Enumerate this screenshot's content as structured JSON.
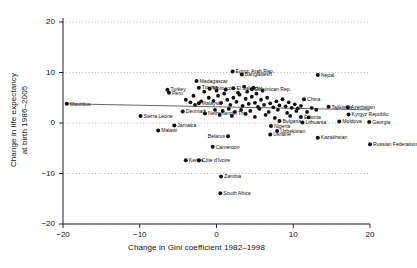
{
  "chart_data": {
    "type": "scatter",
    "title": "",
    "xlabel": "Change in Gini coefficient 1982–1998",
    "ylabel": "Change in life expectancy\nat birth 1986–2005",
    "ylabel_line1": "Change in life expectancy",
    "ylabel_line2": "at birth 1986–2005",
    "xlim": [
      -20,
      20
    ],
    "ylim": [
      -20,
      20
    ],
    "xticks": [
      -20,
      -10,
      0,
      10,
      20
    ],
    "xtick_labels": [
      "−20",
      "−10",
      "0",
      "10",
      "20"
    ],
    "yticks": [
      -20,
      -10,
      0,
      10,
      20
    ],
    "ytick_labels": [
      "−20",
      "−10",
      "0",
      "10",
      "20"
    ],
    "grid": "horizontal-dotted",
    "legend": "none",
    "marker": "filled-circle",
    "marker_color": "#111111",
    "fit_line": {
      "label": "linear fit",
      "x0": -19.5,
      "y0": 3.8,
      "x1": 20.0,
      "y1": 2.6,
      "color": "#555555"
    },
    "points": [
      {
        "label": "Mauritius",
        "x": -19.5,
        "y": 3.8,
        "side": "right"
      },
      {
        "label": "Sierra Leone",
        "x": -9.9,
        "y": 1.4,
        "side": "right"
      },
      {
        "label": "Malawi",
        "x": -7.6,
        "y": -1.5,
        "side": "right"
      },
      {
        "label": "Jamaica",
        "x": -5.5,
        "y": -0.5,
        "side": "right"
      },
      {
        "label": "Turkey",
        "x": -6.4,
        "y": 6.6,
        "side": "right"
      },
      {
        "label": "Peru",
        "x": -6.2,
        "y": 6.0,
        "side": "right"
      },
      {
        "label": "Madagascar",
        "x": -2.6,
        "y": 8.3,
        "side": "right"
      },
      {
        "label": "Tunisia",
        "x": -2.3,
        "y": 7.0,
        "side": "right"
      },
      {
        "label": "Morocco",
        "x": -0.9,
        "y": 6.8,
        "side": "right"
      },
      {
        "label": "El Salvador",
        "x": 2.2,
        "y": 6.9,
        "side": "right"
      },
      {
        "label": "Dominican Rep.",
        "x": 4.6,
        "y": 6.7,
        "side": "right"
      },
      {
        "label": "Egypt, Arab Rep.",
        "x": 2.1,
        "y": 10.2,
        "side": "right"
      },
      {
        "label": "Bangladesh",
        "x": 3.3,
        "y": 9.6,
        "side": "right"
      },
      {
        "label": "Nepal",
        "x": 13.2,
        "y": 9.5,
        "side": "right"
      },
      {
        "label": "Malaysia",
        "x": -2.3,
        "y": 3.9,
        "side": "right"
      },
      {
        "label": "Denmark",
        "x": -4.4,
        "y": 2.3,
        "side": "right"
      },
      {
        "label": "Netherlands, The",
        "x": -1.5,
        "y": 1.9,
        "side": "right"
      },
      {
        "label": "China",
        "x": 11.4,
        "y": 4.7,
        "side": "right"
      },
      {
        "label": "Tajikistan",
        "x": 14.6,
        "y": 3.2,
        "side": "right"
      },
      {
        "label": "Azerbaijan",
        "x": 17.1,
        "y": 3.1,
        "side": "right"
      },
      {
        "label": "Kyrgyz Republic",
        "x": 17.2,
        "y": 1.7,
        "side": "right"
      },
      {
        "label": "Estonia",
        "x": 11.0,
        "y": 1.2,
        "side": "right"
      },
      {
        "label": "Lithuania",
        "x": 11.2,
        "y": 0.1,
        "side": "right"
      },
      {
        "label": "Bulgaria",
        "x": 8.2,
        "y": 0.4,
        "side": "right"
      },
      {
        "label": "Moldova",
        "x": 16.0,
        "y": 0.3,
        "side": "right"
      },
      {
        "label": "Georgia",
        "x": 19.9,
        "y": 0.2,
        "side": "right"
      },
      {
        "label": "Nigeria",
        "x": 7.1,
        "y": -0.6,
        "side": "right"
      },
      {
        "label": "Uzbekistan",
        "x": 7.9,
        "y": -1.6,
        "side": "right"
      },
      {
        "label": "Ukraine",
        "x": 7.0,
        "y": -2.3,
        "side": "right"
      },
      {
        "label": "Belarus",
        "x": 1.5,
        "y": -2.6,
        "side": "left"
      },
      {
        "label": "Kazakhstan",
        "x": 13.2,
        "y": -2.9,
        "side": "right"
      },
      {
        "label": "Russian Federation",
        "x": 20.0,
        "y": -4.2,
        "side": "right"
      },
      {
        "label": "Cameroon",
        "x": -0.5,
        "y": -4.7,
        "side": "right"
      },
      {
        "label": "Kenya",
        "x": -4.0,
        "y": -7.4,
        "side": "right"
      },
      {
        "label": "Côte d'Ivoire",
        "x": -2.3,
        "y": -7.4,
        "side": "right"
      },
      {
        "label": "Zambia",
        "x": 0.6,
        "y": -10.6,
        "side": "right"
      },
      {
        "label": "South Africa",
        "x": 0.5,
        "y": -13.9,
        "side": "right"
      }
    ],
    "unlabeled_points": [
      [
        -1.0,
        5.0
      ],
      [
        -0.4,
        4.4
      ],
      [
        0.2,
        5.4
      ],
      [
        0.6,
        4.0
      ],
      [
        1.0,
        5.8
      ],
      [
        1.4,
        4.6
      ],
      [
        1.8,
        3.6
      ],
      [
        2.2,
        5.0
      ],
      [
        2.6,
        4.2
      ],
      [
        3.0,
        5.6
      ],
      [
        3.4,
        3.4
      ],
      [
        3.8,
        4.8
      ],
      [
        4.2,
        3.8
      ],
      [
        4.6,
        5.2
      ],
      [
        5.0,
        4.0
      ],
      [
        5.4,
        3.2
      ],
      [
        5.8,
        4.6
      ],
      [
        6.2,
        3.6
      ],
      [
        6.6,
        5.0
      ],
      [
        7.0,
        3.9
      ],
      [
        7.4,
        3.1
      ],
      [
        7.8,
        4.3
      ],
      [
        8.2,
        3.5
      ],
      [
        8.6,
        4.7
      ],
      [
        9.0,
        3.3
      ],
      [
        9.4,
        4.1
      ],
      [
        9.8,
        3.0
      ],
      [
        10.2,
        3.7
      ],
      [
        10.6,
        2.9
      ],
      [
        11.0,
        3.4
      ],
      [
        -2.0,
        4.3
      ],
      [
        -2.8,
        3.6
      ],
      [
        -3.4,
        4.1
      ],
      [
        -1.6,
        6.2
      ],
      [
        0.0,
        6.4
      ],
      [
        1.2,
        6.6
      ],
      [
        2.8,
        6.0
      ],
      [
        4.0,
        6.2
      ],
      [
        5.2,
        5.8
      ],
      [
        6.0,
        6.4
      ],
      [
        3.6,
        7.2
      ],
      [
        4.8,
        7.0
      ],
      [
        -0.2,
        2.6
      ],
      [
        0.8,
        2.4
      ],
      [
        1.6,
        2.8
      ],
      [
        2.4,
        2.2
      ],
      [
        3.2,
        2.6
      ],
      [
        4.4,
        2.4
      ],
      [
        5.6,
        2.8
      ],
      [
        6.8,
        2.2
      ],
      [
        8.0,
        2.6
      ],
      [
        9.2,
        2.0
      ],
      [
        10.4,
        2.4
      ],
      [
        11.8,
        2.2
      ],
      [
        12.4,
        3.0
      ],
      [
        13.0,
        2.6
      ],
      [
        0.4,
        1.6
      ],
      [
        2.0,
        1.4
      ],
      [
        3.8,
        1.8
      ],
      [
        5.0,
        1.2
      ],
      [
        6.4,
        1.6
      ],
      [
        7.6,
        1.0
      ],
      [
        9.6,
        1.4
      ],
      [
        12.0,
        1.1
      ],
      [
        -3.0,
        5.4
      ],
      [
        -4.0,
        4.6
      ]
    ]
  }
}
